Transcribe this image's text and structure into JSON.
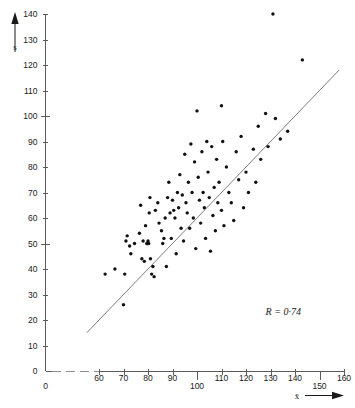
{
  "chart_data": {
    "type": "scatter",
    "title": "",
    "subtitle": "",
    "xlabel": "x̄",
    "ylabel": "s",
    "xlim": [
      55,
      162
    ],
    "ylim": [
      0,
      143
    ],
    "grid": false,
    "legend": "none",
    "x_ticks": [
      {
        "value": 0,
        "label": "0",
        "position": "below"
      },
      {
        "value": 60,
        "label": "60",
        "position": "above"
      },
      {
        "value": 70,
        "label": "70",
        "position": "above"
      },
      {
        "value": 80,
        "label": "80",
        "position": "above"
      },
      {
        "value": 90,
        "label": "90",
        "position": "above"
      },
      {
        "value": 100,
        "label": "100",
        "position": "below"
      },
      {
        "value": 110,
        "label": "110",
        "position": "above"
      },
      {
        "value": 120,
        "label": "120",
        "position": "above"
      },
      {
        "value": 130,
        "label": "130",
        "position": "above"
      },
      {
        "value": 140,
        "label": "140",
        "position": "above"
      },
      {
        "value": 150,
        "label": "150",
        "position": "below"
      },
      {
        "value": 160,
        "label": "160",
        "position": "above"
      }
    ],
    "y_ticks": [
      {
        "value": 0,
        "label": "0",
        "major": false
      },
      {
        "value": 10,
        "label": "10",
        "major": false
      },
      {
        "value": 20,
        "label": "20",
        "major": false
      },
      {
        "value": 30,
        "label": "30",
        "major": false
      },
      {
        "value": 40,
        "label": "40",
        "major": false
      },
      {
        "value": 50,
        "label": "50",
        "major": true
      },
      {
        "value": 60,
        "label": "60",
        "major": false
      },
      {
        "value": 70,
        "label": "70",
        "major": false
      },
      {
        "value": 80,
        "label": "80",
        "major": false
      },
      {
        "value": 90,
        "label": "90",
        "major": false
      },
      {
        "value": 100,
        "label": "100",
        "major": true
      },
      {
        "value": 110,
        "label": "110",
        "major": false
      },
      {
        "value": 120,
        "label": "120",
        "major": false
      },
      {
        "value": 130,
        "label": "130",
        "major": false
      },
      {
        "value": 140,
        "label": "140",
        "major": false
      }
    ],
    "axis_break": {
      "from": 2,
      "to": 57,
      "axis": "x"
    },
    "regression_line": {
      "x_start": 55,
      "y_start": 15,
      "x_end": 158,
      "y_end": 118
    },
    "annotation": {
      "text": "R = 0·74",
      "x": 128,
      "y": 22
    },
    "points": [
      {
        "x": 62.5,
        "y": 38
      },
      {
        "x": 66.5,
        "y": 40
      },
      {
        "x": 70.0,
        "y": 26
      },
      {
        "x": 70.5,
        "y": 38
      },
      {
        "x": 71.0,
        "y": 51
      },
      {
        "x": 71.5,
        "y": 53
      },
      {
        "x": 72.5,
        "y": 49
      },
      {
        "x": 73.0,
        "y": 46
      },
      {
        "x": 74.5,
        "y": 50
      },
      {
        "x": 76.5,
        "y": 54
      },
      {
        "x": 77.0,
        "y": 65
      },
      {
        "x": 77.5,
        "y": 44
      },
      {
        "x": 78.0,
        "y": 51
      },
      {
        "x": 78.5,
        "y": 43
      },
      {
        "x": 79.0,
        "y": 57
      },
      {
        "x": 79.5,
        "y": 50
      },
      {
        "x": 79.8,
        "y": 50
      },
      {
        "x": 80.0,
        "y": 51
      },
      {
        "x": 80.3,
        "y": 50
      },
      {
        "x": 80.5,
        "y": 62
      },
      {
        "x": 80.8,
        "y": 68
      },
      {
        "x": 81.0,
        "y": 44
      },
      {
        "x": 81.5,
        "y": 38
      },
      {
        "x": 82.0,
        "y": 41
      },
      {
        "x": 82.5,
        "y": 37
      },
      {
        "x": 83.0,
        "y": 63
      },
      {
        "x": 84.0,
        "y": 66
      },
      {
        "x": 84.5,
        "y": 58
      },
      {
        "x": 85.5,
        "y": 55
      },
      {
        "x": 86.0,
        "y": 50
      },
      {
        "x": 86.5,
        "y": 52
      },
      {
        "x": 87.0,
        "y": 60
      },
      {
        "x": 87.5,
        "y": 41
      },
      {
        "x": 88.0,
        "y": 68
      },
      {
        "x": 88.5,
        "y": 74
      },
      {
        "x": 89.0,
        "y": 62
      },
      {
        "x": 89.5,
        "y": 52
      },
      {
        "x": 90.0,
        "y": 67
      },
      {
        "x": 90.5,
        "y": 63
      },
      {
        "x": 91.0,
        "y": 60
      },
      {
        "x": 91.5,
        "y": 46
      },
      {
        "x": 92.0,
        "y": 70
      },
      {
        "x": 92.5,
        "y": 64
      },
      {
        "x": 93.0,
        "y": 77
      },
      {
        "x": 93.5,
        "y": 56
      },
      {
        "x": 94.0,
        "y": 69
      },
      {
        "x": 94.5,
        "y": 51
      },
      {
        "x": 95.0,
        "y": 85
      },
      {
        "x": 95.5,
        "y": 66
      },
      {
        "x": 96.0,
        "y": 62
      },
      {
        "x": 96.5,
        "y": 74
      },
      {
        "x": 97.0,
        "y": 56
      },
      {
        "x": 97.5,
        "y": 89
      },
      {
        "x": 98.0,
        "y": 70
      },
      {
        "x": 98.5,
        "y": 60
      },
      {
        "x": 99.0,
        "y": 82
      },
      {
        "x": 99.5,
        "y": 48
      },
      {
        "x": 100.0,
        "y": 102
      },
      {
        "x": 100.5,
        "y": 76
      },
      {
        "x": 101.0,
        "y": 67
      },
      {
        "x": 101.5,
        "y": 58
      },
      {
        "x": 102.0,
        "y": 86
      },
      {
        "x": 102.5,
        "y": 70
      },
      {
        "x": 103.0,
        "y": 64
      },
      {
        "x": 103.5,
        "y": 52
      },
      {
        "x": 104.0,
        "y": 90
      },
      {
        "x": 104.5,
        "y": 78
      },
      {
        "x": 105.0,
        "y": 68
      },
      {
        "x": 105.5,
        "y": 47
      },
      {
        "x": 106.0,
        "y": 88
      },
      {
        "x": 106.5,
        "y": 61
      },
      {
        "x": 107.0,
        "y": 72
      },
      {
        "x": 107.5,
        "y": 55
      },
      {
        "x": 108.0,
        "y": 83
      },
      {
        "x": 108.5,
        "y": 66
      },
      {
        "x": 109.0,
        "y": 74
      },
      {
        "x": 110.0,
        "y": 63
      },
      {
        "x": 110.5,
        "y": 90
      },
      {
        "x": 111.0,
        "y": 57
      },
      {
        "x": 112.0,
        "y": 80
      },
      {
        "x": 113.0,
        "y": 70
      },
      {
        "x": 114.0,
        "y": 66
      },
      {
        "x": 115.0,
        "y": 59
      },
      {
        "x": 116.0,
        "y": 86
      },
      {
        "x": 117.0,
        "y": 75
      },
      {
        "x": 118.0,
        "y": 92
      },
      {
        "x": 119.0,
        "y": 64
      },
      {
        "x": 120.0,
        "y": 78
      },
      {
        "x": 121.0,
        "y": 70
      },
      {
        "x": 123.0,
        "y": 87
      },
      {
        "x": 124.0,
        "y": 74
      },
      {
        "x": 125.0,
        "y": 96
      },
      {
        "x": 126.0,
        "y": 83
      },
      {
        "x": 128.0,
        "y": 101
      },
      {
        "x": 129.0,
        "y": 88
      },
      {
        "x": 131.0,
        "y": 140
      },
      {
        "x": 132.0,
        "y": 99
      },
      {
        "x": 134.0,
        "y": 91
      },
      {
        "x": 137.0,
        "y": 94
      },
      {
        "x": 143.0,
        "y": 122
      },
      {
        "x": 110.0,
        "y": 104
      }
    ]
  }
}
